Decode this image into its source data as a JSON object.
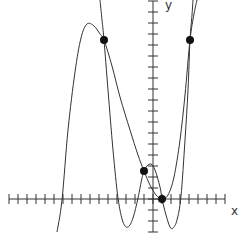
{
  "chart_data": {
    "type": "line",
    "title": "",
    "xlabel": "x",
    "ylabel": "y",
    "grid": false,
    "legend": null,
    "axis": {
      "origin_px": [
        153,
        199
      ],
      "x_unit_px": 9,
      "y_unit_px": 11,
      "x_range": [
        -16,
        8
      ],
      "y_range": [
        -3,
        18
      ],
      "x_ticks_every": 1,
      "y_ticks_every": 1
    },
    "series": [
      {
        "name": "curve-1",
        "points_px": [
          [
            57,
            232
          ],
          [
            62,
            200
          ],
          [
            68,
            130
          ],
          [
            75,
            72
          ],
          [
            81,
            38
          ],
          [
            87,
            24
          ],
          [
            94,
            26
          ],
          [
            100,
            34
          ],
          [
            104,
            40
          ],
          [
            112,
            66
          ],
          [
            120,
            97
          ],
          [
            130,
            130
          ],
          [
            138,
            155
          ],
          [
            144,
            171
          ],
          [
            150,
            185
          ],
          [
            156,
            195
          ],
          [
            162,
            199
          ],
          [
            168,
            195
          ],
          [
            174,
            177
          ],
          [
            180,
            140
          ],
          [
            185,
            95
          ],
          [
            190,
            40
          ],
          [
            194,
            14
          ],
          [
            197,
            0
          ]
        ]
      },
      {
        "name": "curve-2",
        "points_px": [
          [
            100,
            0
          ],
          [
            102,
            20
          ],
          [
            104,
            40
          ],
          [
            108,
            90
          ],
          [
            113,
            150
          ],
          [
            118,
            198
          ],
          [
            123,
            222
          ],
          [
            128,
            227
          ],
          [
            133,
            218
          ],
          [
            138,
            198
          ],
          [
            142,
            178
          ],
          [
            144,
            171
          ],
          [
            147,
            166
          ],
          [
            151,
            164
          ],
          [
            155,
            170
          ],
          [
            160,
            187
          ],
          [
            162,
            199
          ],
          [
            166,
            215
          ],
          [
            170,
            227
          ],
          [
            173,
            228
          ],
          [
            177,
            220
          ],
          [
            181,
            196
          ],
          [
            185,
            140
          ],
          [
            188,
            90
          ],
          [
            190,
            40
          ],
          [
            192,
            15
          ],
          [
            193,
            0
          ]
        ]
      }
    ],
    "points": [
      {
        "x": -5,
        "y": 14.5,
        "px": [
          104,
          40
        ]
      },
      {
        "x": 4,
        "y": 14.5,
        "px": [
          190,
          40
        ]
      },
      {
        "x": -1,
        "y": 2.5,
        "px": [
          144,
          171
        ]
      },
      {
        "x": 1,
        "y": 0,
        "px": [
          162,
          199
        ]
      }
    ]
  },
  "labels": {
    "x_axis": "x",
    "y_axis": "y"
  }
}
